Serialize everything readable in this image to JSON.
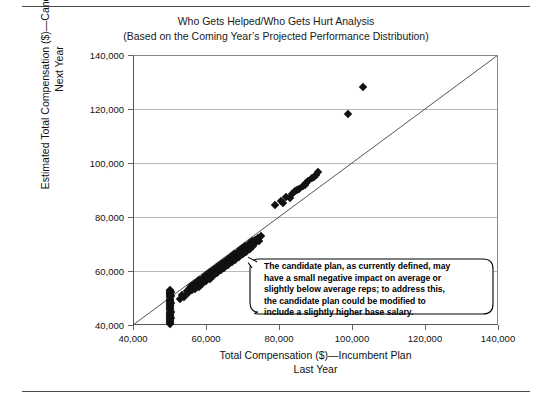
{
  "title": {
    "line1": "Who Gets Helped/Who Gets Hurt Analysis",
    "line2": "(Based on the Coming Year’s Projected Performance Distribution)"
  },
  "axes": {
    "y_title_line1": "Estimated Total Compensation ($)—Candidate Plan",
    "y_title_line2": "Next Year",
    "x_title_line1": "Total Compensation ($)—Incumbent Plan",
    "x_title_line2": "Last Year",
    "y_ticks": [
      "40,000",
      "60,000",
      "80,000",
      "100,000",
      "120,000",
      "140,000"
    ],
    "x_ticks": [
      "40,000",
      "60,000",
      "80,000",
      "100,000",
      "120,000",
      "140,000"
    ]
  },
  "callout": {
    "line1": "The candidate plan, as currently defined, may",
    "line2": "have a small negative impact on average or",
    "line3": "slightly below average reps; to address this,",
    "line4": "the candidate plan could be modified to",
    "line5": "include a slightly higher base salary."
  },
  "colors": {
    "marker": "#111111",
    "gridline": "#b9b9b9",
    "axis": "#555555",
    "reference_line": "#555555",
    "rule": "#4a4a4a"
  },
  "chart_data": {
    "type": "scatter",
    "title": "Who Gets Helped/Who Gets Hurt Analysis",
    "subtitle": "(Based on the Coming Year’s Projected Performance Distribution)",
    "xlabel": "Total Compensation ($)—Incumbent Plan Last Year",
    "ylabel": "Estimated Total Compensation ($)—Candidate Plan Next Year",
    "xlim": [
      40000,
      140000
    ],
    "ylim": [
      40000,
      140000
    ],
    "xticks": [
      40000,
      60000,
      80000,
      100000,
      120000,
      140000
    ],
    "yticks": [
      40000,
      60000,
      80000,
      100000,
      120000,
      140000
    ],
    "grid": "horizontal",
    "legend": "none",
    "reference_line": {
      "label": "y = x (45-degree parity line)",
      "from": [
        40000,
        40000
      ],
      "to": [
        140000,
        140000
      ]
    },
    "series": [
      {
        "name": "Employees",
        "marker": "diamond",
        "color": "#111111",
        "points": [
          [
            50000,
            40200
          ],
          [
            50000,
            40600
          ],
          [
            50000,
            41000
          ],
          [
            50000,
            41400
          ],
          [
            50000,
            41800
          ],
          [
            50000,
            42200
          ],
          [
            50000,
            42600
          ],
          [
            50000,
            43000
          ],
          [
            50000,
            43400
          ],
          [
            50000,
            43800
          ],
          [
            50000,
            44200
          ],
          [
            50000,
            44600
          ],
          [
            50000,
            45000
          ],
          [
            50000,
            45400
          ],
          [
            50000,
            45800
          ],
          [
            50000,
            46200
          ],
          [
            50000,
            46600
          ],
          [
            50000,
            47000
          ],
          [
            50000,
            47400
          ],
          [
            50000,
            47800
          ],
          [
            50000,
            48200
          ],
          [
            50000,
            48600
          ],
          [
            50000,
            49000
          ],
          [
            50000,
            49400
          ],
          [
            50000,
            49800
          ],
          [
            50000,
            50200
          ],
          [
            50000,
            50600
          ],
          [
            50000,
            51000
          ],
          [
            50000,
            51400
          ],
          [
            50000,
            51800
          ],
          [
            50000,
            52200
          ],
          [
            50000,
            52600
          ],
          [
            50000,
            53000
          ],
          [
            50400,
            52400
          ],
          [
            50400,
            50800
          ],
          [
            50400,
            48000
          ],
          [
            50400,
            45000
          ],
          [
            50400,
            42500
          ],
          [
            55500,
            53800
          ],
          [
            56000,
            54600
          ],
          [
            56400,
            53600
          ],
          [
            56800,
            55200
          ],
          [
            57200,
            54400
          ],
          [
            57600,
            56000
          ],
          [
            57900,
            55000
          ],
          [
            58200,
            56600
          ],
          [
            58500,
            55600
          ],
          [
            58800,
            57200
          ],
          [
            59100,
            56200
          ],
          [
            59400,
            57800
          ],
          [
            59700,
            56800
          ],
          [
            60000,
            58400
          ],
          [
            60300,
            57400
          ],
          [
            60600,
            59000
          ],
          [
            60900,
            58000
          ],
          [
            61200,
            59600
          ],
          [
            61500,
            58600
          ],
          [
            61800,
            60200
          ],
          [
            62100,
            59200
          ],
          [
            62400,
            60800
          ],
          [
            62700,
            59800
          ],
          [
            63000,
            61400
          ],
          [
            63300,
            60400
          ],
          [
            63600,
            62000
          ],
          [
            63900,
            61000
          ],
          [
            64200,
            62600
          ],
          [
            64500,
            61600
          ],
          [
            64800,
            63200
          ],
          [
            65100,
            62200
          ],
          [
            65400,
            63800
          ],
          [
            65700,
            62800
          ],
          [
            66000,
            64400
          ],
          [
            66300,
            63400
          ],
          [
            66600,
            65000
          ],
          [
            66900,
            64000
          ],
          [
            67200,
            65600
          ],
          [
            67500,
            64600
          ],
          [
            67800,
            66200
          ],
          [
            68100,
            65200
          ],
          [
            68400,
            66800
          ],
          [
            68700,
            65800
          ],
          [
            69000,
            67400
          ],
          [
            69300,
            66400
          ],
          [
            69600,
            68000
          ],
          [
            69900,
            67000
          ],
          [
            70200,
            68600
          ],
          [
            70500,
            67600
          ],
          [
            70800,
            69200
          ],
          [
            71100,
            68200
          ],
          [
            71400,
            69800
          ],
          [
            71700,
            68800
          ],
          [
            72000,
            70400
          ],
          [
            72300,
            69400
          ],
          [
            72600,
            71000
          ],
          [
            73000,
            70000
          ],
          [
            73400,
            71600
          ],
          [
            73800,
            70600
          ],
          [
            74200,
            72200
          ],
          [
            74600,
            71200
          ],
          [
            75000,
            72800
          ],
          [
            54800,
            52600
          ],
          [
            55200,
            51800
          ],
          [
            56200,
            52800
          ],
          [
            57000,
            53200
          ],
          [
            58000,
            54200
          ],
          [
            59000,
            55200
          ],
          [
            60000,
            56200
          ],
          [
            61000,
            57200
          ],
          [
            62000,
            58200
          ],
          [
            63000,
            59200
          ],
          [
            64000,
            60200
          ],
          [
            65000,
            61200
          ],
          [
            66000,
            62200
          ],
          [
            67000,
            63200
          ],
          [
            68000,
            64200
          ],
          [
            69000,
            65200
          ],
          [
            70000,
            66200
          ],
          [
            71000,
            67200
          ],
          [
            72000,
            68200
          ],
          [
            73000,
            69200
          ],
          [
            53500,
            51000
          ],
          [
            54000,
            50400
          ],
          [
            53000,
            49600
          ],
          [
            79000,
            84500
          ],
          [
            80500,
            86000
          ],
          [
            82000,
            87500
          ],
          [
            83500,
            88500
          ],
          [
            84500,
            89500
          ],
          [
            85500,
            90500
          ],
          [
            86500,
            91500
          ],
          [
            87500,
            92500
          ],
          [
            88000,
            93500
          ],
          [
            89000,
            94500
          ],
          [
            90000,
            95500
          ],
          [
            90800,
            96500
          ],
          [
            81000,
            85200
          ],
          [
            83000,
            87000
          ],
          [
            85000,
            90000
          ],
          [
            87000,
            92000
          ],
          [
            89500,
            95000
          ],
          [
            99000,
            118000
          ],
          [
            103000,
            128000
          ]
        ]
      }
    ],
    "annotation": {
      "text": "The candidate plan, as currently defined, may have a small negative impact on average or slightly below average reps; to address this, the candidate plan could be modified to include a slightly higher base salary.",
      "shape": "rounded-callout"
    }
  }
}
